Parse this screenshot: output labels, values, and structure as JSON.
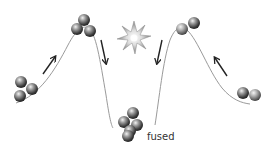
{
  "diagram": {
    "colors": {
      "curve": "#9a9a9a",
      "arrow": "#222222",
      "ball_dark": "#2e2e2e",
      "ball_mid": "#7a7a7a",
      "ball_light": "#e6e6e6",
      "burst": "#8c8c8c",
      "background": "#ffffff"
    },
    "labels": {
      "fused": "fused"
    },
    "nodes": [
      {
        "id": "left-start-nucleus",
        "balls": 3,
        "position": "left-slope-bottom"
      },
      {
        "id": "left-peak-nucleus",
        "balls": 3,
        "position": "left-peak"
      },
      {
        "id": "right-peak-nucleus",
        "balls": 2,
        "position": "right-peak"
      },
      {
        "id": "right-start-nucleus",
        "balls": 2,
        "position": "right-slope-bottom"
      },
      {
        "id": "fused-nucleus",
        "balls": 5,
        "position": "central-well"
      }
    ],
    "arrows": [
      {
        "id": "left-up-arrow",
        "direction": "up-right"
      },
      {
        "id": "left-down-arrow",
        "direction": "down"
      },
      {
        "id": "right-down-arrow",
        "direction": "down"
      },
      {
        "id": "right-up-arrow",
        "direction": "up-left"
      }
    ],
    "icons": {
      "burst": "collision-starburst-icon"
    }
  }
}
